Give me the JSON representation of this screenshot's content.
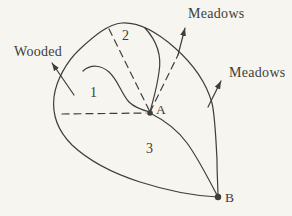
{
  "figure": {
    "colors": {
      "background": "#f6f5f0",
      "ink": "#403e39"
    },
    "labels": {
      "wooded": "Wooded",
      "meadows_top": "Meadows",
      "meadows_right": "Meadows",
      "region_1": "1",
      "region_2": "2",
      "region_3": "3",
      "point_a": "A",
      "point_b": "B"
    }
  }
}
